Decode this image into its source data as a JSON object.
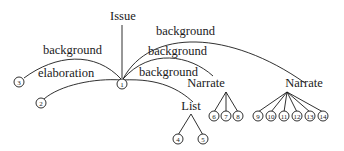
{
  "diagram": {
    "root": {
      "label": "Issue"
    },
    "edges": {
      "bg_left": "background",
      "elaboration": "elaboration",
      "bg_top": "background",
      "bg_mid": "background",
      "bg_low": "background"
    },
    "relations": {
      "narrate1": "Narrate",
      "narrate2": "Narrate",
      "list": "List"
    },
    "nodes": {
      "n1": "1",
      "n2": "2",
      "n3": "3",
      "n4": "4",
      "n5": "5",
      "n6": "6",
      "n7": "7",
      "n8": "8",
      "n9": "9",
      "n10": "10",
      "n11": "11",
      "n12": "12",
      "n13": "13",
      "n14": "14"
    },
    "colors": {
      "stroke": "#1a1a1a",
      "background": "#ffffff"
    }
  }
}
